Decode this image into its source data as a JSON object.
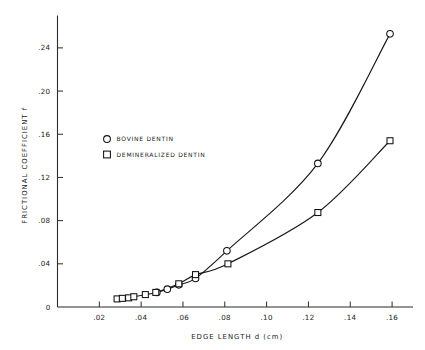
{
  "chart_data": {
    "type": "scatter",
    "title": "",
    "xlabel": "EDGE LENGTH   d   (cm)",
    "ylabel": "FRICTIONAL COEFFICIENT   f",
    "xlim": [
      0.0,
      0.17
    ],
    "ylim": [
      0.0,
      0.27
    ],
    "xticks": [
      0.02,
      0.04,
      0.06,
      0.08,
      0.1,
      0.12,
      0.14,
      0.16
    ],
    "xticklabels": [
      ".02",
      ".04",
      ".06",
      ".08",
      ".10",
      ".12",
      ".14",
      ".16"
    ],
    "yticks": [
      0.0,
      0.04,
      0.08,
      0.12,
      0.16,
      0.2,
      0.24
    ],
    "yticklabels": [
      "0",
      ".04",
      ".08",
      ".12",
      ".16",
      ".20",
      ".24"
    ],
    "grid": false,
    "legend_position": "upper-left-inside",
    "series": [
      {
        "name": "BOVINE DENTIN",
        "marker": "circle",
        "points": [
          {
            "x": 0.0475,
            "y": 0.0135
          },
          {
            "x": 0.0525,
            "y": 0.0165
          },
          {
            "x": 0.058,
            "y": 0.0205
          },
          {
            "x": 0.066,
            "y": 0.0265
          },
          {
            "x": 0.081,
            "y": 0.052
          },
          {
            "x": 0.1245,
            "y": 0.133
          },
          {
            "x": 0.159,
            "y": 0.253
          }
        ]
      },
      {
        "name": "DEMINERALIZED DENTIN",
        "marker": "square",
        "points": [
          {
            "x": 0.0285,
            "y": 0.0075
          },
          {
            "x": 0.031,
            "y": 0.008
          },
          {
            "x": 0.034,
            "y": 0.0085
          },
          {
            "x": 0.0365,
            "y": 0.0095
          },
          {
            "x": 0.042,
            "y": 0.0115
          },
          {
            "x": 0.047,
            "y": 0.0135
          },
          {
            "x": 0.058,
            "y": 0.0215
          },
          {
            "x": 0.066,
            "y": 0.03
          },
          {
            "x": 0.0815,
            "y": 0.04
          },
          {
            "x": 0.1245,
            "y": 0.0875
          },
          {
            "x": 0.159,
            "y": 0.154
          }
        ]
      }
    ],
    "legend": [
      {
        "label": "BOVINE DENTIN",
        "marker": "circle"
      },
      {
        "label": "DEMINERALIZED DENTIN",
        "marker": "square"
      }
    ]
  }
}
